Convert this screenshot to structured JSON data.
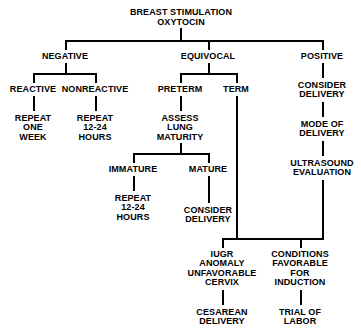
{
  "diagram": {
    "root": {
      "label": "BREAST STIMULATION\nOXYTOCIN"
    },
    "nodes": {
      "negative": "NEGATIVE",
      "equivocal": "EQUIVOCAL",
      "positive": "POSITIVE",
      "reactive": "REACTIVE",
      "nonreactive": "NONREACTIVE",
      "preterm": "PRETERM",
      "term": "TERM",
      "repeat_one_week": "REPEAT\nONE\nWEEK",
      "repeat_12_24_hours_a": "REPEAT\n12-24\nHOURS",
      "assess_lung_maturity": "ASSESS\nLUNG\nMATURITY",
      "consider_delivery_positive": "CONSIDER\nDELIVERY",
      "immature": "IMMATURE",
      "mature": "MATURE",
      "repeat_12_24_hours_b": "REPEAT\n12-24\nHOURS",
      "consider_delivery_mature": "CONSIDER\nDELIVERY",
      "mode_of_delivery": "MODE OF\nDELIVERY",
      "ultrasound_evaluation": "ULTRASOUND\nEVALUATION",
      "iugr_anomaly": "IUGR\nANOMALY\nUNFAVORABLE\nCERVIX",
      "conditions_favorable": "CONDITIONS\nFAVORABLE\nFOR\nINDUCTION",
      "cesarean_delivery": "CESAREAN\nDELIVERY",
      "trial_of_labor": "TRIAL OF\nLABOR"
    },
    "colors": {
      "line": "#000000",
      "text": "#000000",
      "background": "#ffffff"
    }
  }
}
